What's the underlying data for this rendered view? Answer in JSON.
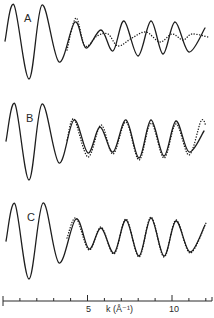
{
  "chart_data": {
    "type": "line",
    "title": "",
    "xlabel": "k (Å⁻¹)",
    "ylabel": "",
    "xlim": [
      0,
      12.3
    ],
    "grid": false,
    "legend": null,
    "x_ticks": {
      "major": [
        5,
        10
      ],
      "minor": [
        1,
        2,
        3,
        4,
        6,
        7,
        8,
        9,
        11,
        12
      ]
    },
    "tick_labels": [
      "5",
      "10"
    ],
    "panels": [
      {
        "label": "A",
        "series": [
          {
            "name": "solid",
            "style": "solid",
            "points": [
              [
                5,
                41
              ],
              [
                14,
                5
              ],
              [
                29,
                79
              ],
              [
                42,
                5
              ],
              [
                59,
                62
              ],
              [
                75,
                22
              ],
              [
                86,
                48
              ],
              [
                101,
                30
              ],
              [
                113,
                51
              ],
              [
                124,
                21
              ],
              [
                138,
                56
              ],
              [
                151,
                21
              ],
              [
                163,
                54
              ],
              [
                175,
                22
              ],
              [
                189,
                52
              ],
              [
                205,
                28
              ]
            ]
          },
          {
            "name": "dotted",
            "style": "dotted",
            "points": [
              [
                67,
                50
              ],
              [
                76,
                18
              ],
              [
                85,
                46
              ],
              [
                97,
                36
              ],
              [
                108,
                34
              ],
              [
                118,
                46
              ],
              [
                132,
                38
              ],
              [
                146,
                32
              ],
              [
                160,
                42
              ],
              [
                172,
                34
              ],
              [
                183,
                40
              ],
              [
                192,
                34
              ],
              [
                208,
                37
              ]
            ]
          }
        ]
      },
      {
        "label": "B",
        "series": [
          {
            "name": "solid",
            "style": "solid",
            "points": [
              [
                6,
                141
              ],
              [
                15,
                104
              ],
              [
                29,
                180
              ],
              [
                42,
                104
              ],
              [
                59,
                163
              ],
              [
                74,
                120
              ],
              [
                88,
                153
              ],
              [
                100,
                127
              ],
              [
                113,
                152
              ],
              [
                126,
                120
              ],
              [
                139,
                158
              ],
              [
                151,
                120
              ],
              [
                164,
                156
              ],
              [
                176,
                121
              ],
              [
                189,
                152
              ],
              [
                204,
                131
              ]
            ]
          },
          {
            "name": "dotted",
            "style": "dotted",
            "points": [
              [
                67,
                140
              ],
              [
                74,
                119
              ],
              [
                88,
                157
              ],
              [
                101,
                125
              ],
              [
                113,
                154
              ],
              [
                126,
                122
              ],
              [
                139,
                160
              ],
              [
                151,
                123
              ],
              [
                164,
                158
              ],
              [
                176,
                124
              ],
              [
                189,
                155
              ],
              [
                201,
                121
              ],
              [
                206,
                126
              ]
            ]
          }
        ]
      },
      {
        "label": "C",
        "series": [
          {
            "name": "solid",
            "style": "solid",
            "points": [
              [
                6,
                241
              ],
              [
                15,
                204
              ],
              [
                29,
                279
              ],
              [
                43,
                203
              ],
              [
                59,
                263
              ],
              [
                76,
                219
              ],
              [
                89,
                249
              ],
              [
                101,
                228
              ],
              [
                114,
                253
              ],
              [
                126,
                220
              ],
              [
                139,
                256
              ],
              [
                151,
                218
              ],
              [
                164,
                256
              ],
              [
                176,
                221
              ],
              [
                190,
                252
              ],
              [
                205,
                225
              ]
            ]
          },
          {
            "name": "dotted",
            "style": "dotted",
            "points": [
              [
                67,
                238
              ],
              [
                76,
                218
              ],
              [
                89,
                250
              ],
              [
                101,
                227
              ],
              [
                114,
                254
              ],
              [
                126,
                219
              ],
              [
                139,
                257
              ],
              [
                151,
                217
              ],
              [
                164,
                257
              ],
              [
                176,
                220
              ],
              [
                190,
                253
              ],
              [
                206,
                223
              ]
            ]
          }
        ]
      }
    ],
    "axis_pixels": {
      "y": 301,
      "x0": 3,
      "px_per_unit": 16.9,
      "x_end": 212
    }
  },
  "labels": {
    "panel_a": "A",
    "panel_b": "B",
    "panel_c": "C",
    "tick_5": "5",
    "tick_10": "10",
    "xlabel": "k (Å⁻¹)"
  }
}
